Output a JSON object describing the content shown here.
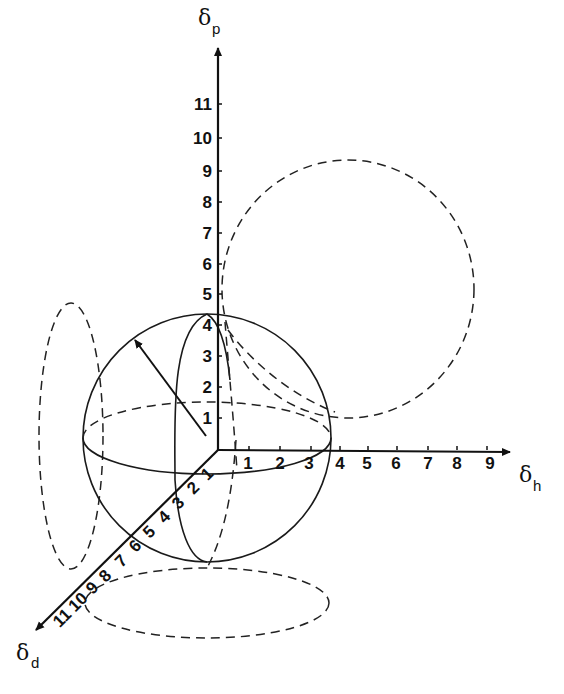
{
  "diagram": {
    "axes": {
      "p": {
        "symbol": "δ",
        "subscript": "p",
        "ticks": [
          "1",
          "2",
          "3",
          "4",
          "5",
          "6",
          "7",
          "8",
          "9",
          "10",
          "11"
        ]
      },
      "h": {
        "symbol": "δ",
        "subscript": "h",
        "ticks": [
          "1",
          "2",
          "3",
          "4",
          "5",
          "6",
          "7",
          "8",
          "9"
        ]
      },
      "d": {
        "symbol": "δ",
        "subscript": "d",
        "ticks": [
          "1",
          "2",
          "3",
          "4",
          "5",
          "6",
          "7",
          "8",
          "9",
          "10",
          "11"
        ]
      }
    },
    "elements": {
      "sphere": "solid sphere centred near origin with radius arrow",
      "projection_ph": "dashed circle in δp–δh plane",
      "projection_pd": "dashed ellipse in δp–δd plane",
      "projection_hd": "dashed ellipse in δh–δd plane"
    },
    "colors": {
      "ink": "#111111",
      "background": "#ffffff"
    }
  }
}
